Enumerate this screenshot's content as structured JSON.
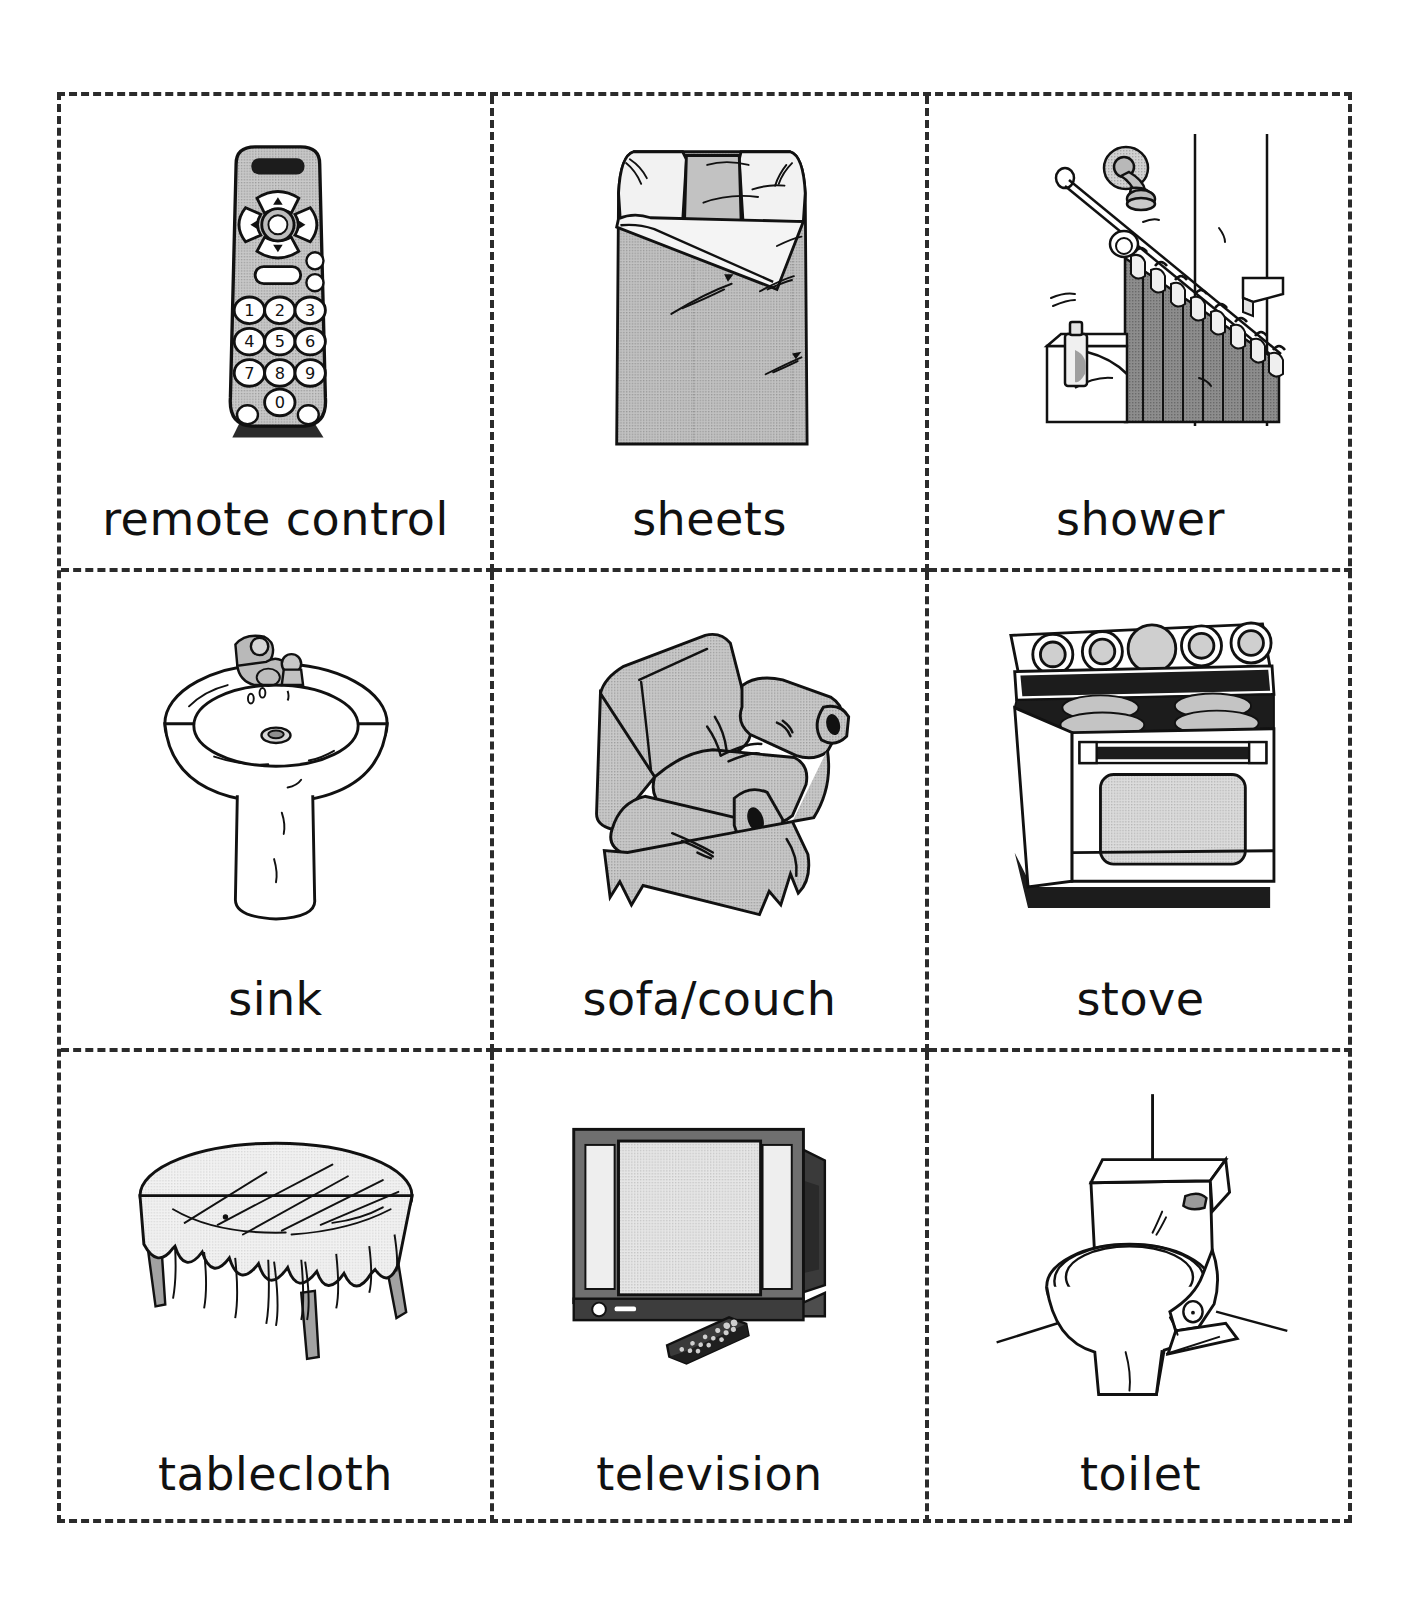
{
  "page": {
    "type": "picture-vocabulary-flashcard-sheet",
    "columns": 3,
    "rows": 3,
    "border_style": "dashed",
    "border_color": "#2b2b2b",
    "background_color": "#ffffff"
  },
  "palette": {
    "ink": "#111111",
    "line": "#1a1a1a",
    "light_gray": "#e8e8e8",
    "mid_gray": "#b6b6b6",
    "dark_gray": "#808080",
    "darker_gray": "#5a5a5a",
    "near_black": "#2b2b2b"
  },
  "cards": [
    {
      "id": "remote-control",
      "label": "remote control",
      "icon": "remote-control-illustration",
      "row": 1,
      "col": 1
    },
    {
      "id": "sheets",
      "label": "sheets",
      "icon": "sheets-illustration",
      "row": 1,
      "col": 2
    },
    {
      "id": "shower",
      "label": "shower",
      "icon": "shower-illustration",
      "row": 1,
      "col": 3
    },
    {
      "id": "sink",
      "label": "sink",
      "icon": "sink-illustration",
      "row": 2,
      "col": 1
    },
    {
      "id": "sofa-couch",
      "label": "sofa/couch",
      "icon": "sofa-couch-illustration",
      "row": 2,
      "col": 2
    },
    {
      "id": "stove",
      "label": "stove",
      "icon": "stove-illustration",
      "row": 2,
      "col": 3
    },
    {
      "id": "tablecloth",
      "label": "tablecloth",
      "icon": "tablecloth-illustration",
      "row": 3,
      "col": 1
    },
    {
      "id": "television",
      "label": "television",
      "icon": "television-illustration",
      "row": 3,
      "col": 2
    },
    {
      "id": "toilet",
      "label": "toilet",
      "icon": "toilet-illustration",
      "row": 3,
      "col": 3
    }
  ],
  "remote_keypad": {
    "digits": [
      "1",
      "2",
      "3",
      "4",
      "5",
      "6",
      "7",
      "8",
      "9",
      "0"
    ],
    "dpad": [
      "up-arrow",
      "down-arrow",
      "left-arrow",
      "right-arrow",
      "center-button"
    ]
  }
}
